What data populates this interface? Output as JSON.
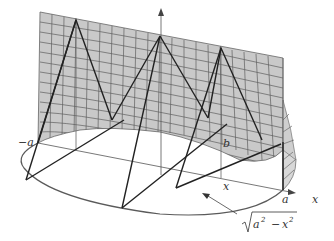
{
  "figure": {
    "labels": {
      "neg_a": "−a",
      "a": "a",
      "b": "b",
      "x_point": "x",
      "x_axis": "x",
      "half_width_radicand_a": "a",
      "half_width_radicand_x": "x",
      "half_width_minus": "−",
      "half_width_exp": "2"
    },
    "colors": {
      "surface_fill": "#c8c8c8",
      "surface_grid": "#5a5a5a",
      "triangle_edges": "#222222",
      "base_curve": "#555555",
      "axis": "#444444"
    }
  }
}
